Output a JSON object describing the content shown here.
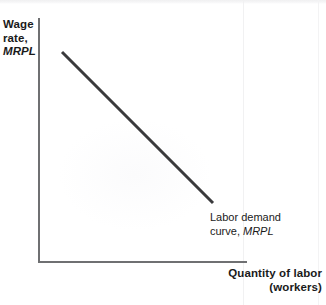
{
  "figure": {
    "background_color": "#ffffff",
    "width": 326,
    "height": 305
  },
  "axes": {
    "color": "#6f7072",
    "y_axis": {
      "title_line1": "Wage",
      "title_line2": "rate,",
      "title_line3": "MRPL"
    },
    "x_axis": {
      "title_line1": "Quantity of labor",
      "title_line2": "(workers)"
    }
  },
  "annotations": {
    "demand_curve": {
      "line1": "Labor demand",
      "line2_prefix": "curve, ",
      "line2_italic": "MRPL"
    }
  },
  "chart_data": {
    "type": "line",
    "title": "",
    "subtitle": "",
    "xlabel": "Quantity of labor (workers)",
    "ylabel": "Wage rate, MRPL",
    "grid": false,
    "legend_position": "none",
    "axis_ticks": {
      "x": [],
      "y": []
    },
    "xlim": [
      0,
      100
    ],
    "ylim": [
      0,
      100
    ],
    "series": [
      {
        "name": "Labor demand curve, MRPL",
        "color": "#3a3a3c",
        "line_width": 3,
        "slope": "negative",
        "x": [
          11,
          82
        ],
        "y": [
          86,
          24
        ],
        "pixel_start": [
          62,
          52
        ],
        "pixel_end": [
          213,
          203
        ],
        "annotation": "Labor demand curve, MRPL"
      }
    ]
  }
}
